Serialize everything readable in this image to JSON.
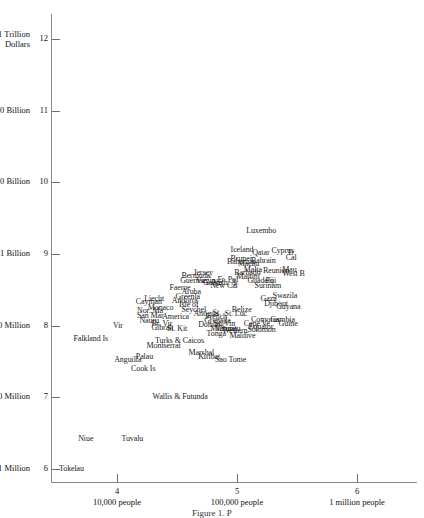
{
  "chart_data": {
    "type": "scatter",
    "title": "",
    "xlabel": "",
    "ylabel": "",
    "xlim": [
      3.45,
      6.5
    ],
    "ylim": [
      5.82,
      12.35
    ],
    "grid": false,
    "legend": null,
    "axis_note": "Both axes are log10 scales: x = log10(population), y = log10(GDP in dollars)",
    "y_ticks": [
      {
        "value": 12,
        "num": "12",
        "word": "1 Trillion Dollars"
      },
      {
        "value": 11,
        "num": "11",
        "word": "100 Billion"
      },
      {
        "value": 10,
        "num": "10",
        "word": "10 Billion"
      },
      {
        "value": 9,
        "num": "9",
        "word": "1 Billion"
      },
      {
        "value": 8,
        "num": "8",
        "word": "100 Million"
      },
      {
        "value": 7,
        "num": "7",
        "word": "10 Million"
      },
      {
        "value": 6,
        "num": "6",
        "word": "1 Million"
      }
    ],
    "x_ticks": [
      {
        "value": 4,
        "num": "4",
        "word": "10,000 people"
      },
      {
        "value": 5,
        "num": "5",
        "word": "100,000 people"
      },
      {
        "value": 6,
        "num": "6",
        "word": "1 million people"
      }
    ],
    "points": [
      {
        "label": "Tokelau",
        "x": 3.5,
        "y": 6.0
      },
      {
        "label": "Niue",
        "x": 3.66,
        "y": 6.42
      },
      {
        "label": "Tuvalu",
        "x": 4.02,
        "y": 6.42
      },
      {
        "label": "Wallis & Futunda",
        "x": 4.28,
        "y": 7.0
      },
      {
        "label": "Falkland Is",
        "x": 3.62,
        "y": 7.82
      },
      {
        "label": "Anguilla",
        "x": 3.96,
        "y": 7.52
      },
      {
        "label": "Cook Is",
        "x": 4.1,
        "y": 7.4
      },
      {
        "label": "Palau",
        "x": 4.14,
        "y": 7.57
      },
      {
        "label": "Montserrat",
        "x": 4.23,
        "y": 7.72
      },
      {
        "label": "Turks & Caicos",
        "x": 4.3,
        "y": 7.79
      },
      {
        "label": "Marshal",
        "x": 4.58,
        "y": 7.62
      },
      {
        "label": "Kiribat",
        "x": 4.66,
        "y": 7.56
      },
      {
        "label": "Sao Tome",
        "x": 4.8,
        "y": 7.52
      },
      {
        "label": "Nauru",
        "x": 4.17,
        "y": 8.07
      },
      {
        "label": "Br. Vir",
        "x": 4.27,
        "y": 8.02
      },
      {
        "label": "Gibralt",
        "x": 4.27,
        "y": 7.97
      },
      {
        "label": "St. Kit",
        "x": 4.4,
        "y": 7.96
      },
      {
        "label": "Vir",
        "x": 3.95,
        "y": 7.99
      },
      {
        "label": "San Mar",
        "x": 4.15,
        "y": 8.14
      },
      {
        "label": "America",
        "x": 4.36,
        "y": 8.12
      },
      {
        "label": "Nor. Ma",
        "x": 4.15,
        "y": 8.21
      },
      {
        "label": "Monaco",
        "x": 4.24,
        "y": 8.25
      },
      {
        "label": "Liecht",
        "x": 4.21,
        "y": 8.37
      },
      {
        "label": "Cayman",
        "x": 4.14,
        "y": 8.33
      },
      {
        "label": "Andorra",
        "x": 4.44,
        "y": 8.35
      },
      {
        "label": "Greenla",
        "x": 4.47,
        "y": 8.4
      },
      {
        "label": "Isle of",
        "x": 4.5,
        "y": 8.29
      },
      {
        "label": "Seychel",
        "x": 4.52,
        "y": 8.22
      },
      {
        "label": "Aruba",
        "x": 4.52,
        "y": 8.47
      },
      {
        "label": "Faeroe",
        "x": 4.42,
        "y": 8.52
      },
      {
        "label": "Antigua",
        "x": 4.62,
        "y": 8.17
      },
      {
        "label": "St.",
        "x": 4.78,
        "y": 8.18
      },
      {
        "label": "French",
        "x": 4.72,
        "y": 8.12
      },
      {
        "label": "Grenada",
        "x": 4.71,
        "y": 8.07
      },
      {
        "label": "Dominic",
        "x": 4.66,
        "y": 8.01
      },
      {
        "label": "St. Vin",
        "x": 4.79,
        "y": 8.02
      },
      {
        "label": "Microne",
        "x": 4.76,
        "y": 7.96
      },
      {
        "label": "Vanuatu",
        "x": 4.8,
        "y": 7.95
      },
      {
        "label": "Western",
        "x": 4.86,
        "y": 7.92
      },
      {
        "label": "Tonga",
        "x": 4.73,
        "y": 7.89
      },
      {
        "label": "Maldive",
        "x": 4.92,
        "y": 7.86
      },
      {
        "label": "Belize",
        "x": 4.94,
        "y": 8.22
      },
      {
        "label": "St. Luc",
        "x": 4.88,
        "y": 8.17
      },
      {
        "label": "Comoros",
        "x": 5.1,
        "y": 8.08
      },
      {
        "label": "Cape Ve",
        "x": 5.04,
        "y": 8.02
      },
      {
        "label": "Equator",
        "x": 5.08,
        "y": 7.98
      },
      {
        "label": "Solomon",
        "x": 5.07,
        "y": 7.94
      },
      {
        "label": "Gambia",
        "x": 5.26,
        "y": 8.08
      },
      {
        "label": "Guine",
        "x": 5.33,
        "y": 8.02
      },
      {
        "label": "Djibout",
        "x": 5.21,
        "y": 8.3
      },
      {
        "label": "Guyana",
        "x": 5.31,
        "y": 8.26
      },
      {
        "label": "Gaza",
        "x": 5.18,
        "y": 8.37
      },
      {
        "label": "Swazila",
        "x": 5.28,
        "y": 8.42
      },
      {
        "label": "Surinam",
        "x": 5.13,
        "y": 8.55
      },
      {
        "label": "Fiji",
        "x": 5.22,
        "y": 8.62
      },
      {
        "label": "Guadelo",
        "x": 5.07,
        "y": 8.62
      },
      {
        "label": "Martini",
        "x": 4.98,
        "y": 8.68
      },
      {
        "label": "Fr. Pol",
        "x": 4.82,
        "y": 8.64
      },
      {
        "label": "Neth. A",
        "x": 4.78,
        "y": 8.6
      },
      {
        "label": "Guam",
        "x": 4.7,
        "y": 8.6
      },
      {
        "label": "New Cal",
        "x": 4.76,
        "y": 8.56
      },
      {
        "label": "Virgin",
        "x": 4.64,
        "y": 8.63
      },
      {
        "label": "Guernse",
        "x": 4.51,
        "y": 8.63
      },
      {
        "label": "Bermuda",
        "x": 4.52,
        "y": 8.69
      },
      {
        "label": "Jersey",
        "x": 4.62,
        "y": 8.74
      },
      {
        "label": "Barbado",
        "x": 4.96,
        "y": 8.74
      },
      {
        "label": "Malta",
        "x": 5.04,
        "y": 8.78
      },
      {
        "label": "Reunion",
        "x": 5.2,
        "y": 8.76
      },
      {
        "label": "Mau",
        "x": 5.36,
        "y": 8.78
      },
      {
        "label": "West B",
        "x": 5.36,
        "y": 8.72
      },
      {
        "label": "Macau",
        "x": 4.99,
        "y": 8.86
      },
      {
        "label": "Bahamas",
        "x": 4.9,
        "y": 8.89
      },
      {
        "label": "Bahrain",
        "x": 5.1,
        "y": 8.9
      },
      {
        "label": "Brunei",
        "x": 4.93,
        "y": 8.93
      },
      {
        "label": "Qatar",
        "x": 5.11,
        "y": 9.02
      },
      {
        "label": "Cyprus",
        "x": 5.27,
        "y": 9.05
      },
      {
        "label": "Tr",
        "x": 5.4,
        "y": 9.02
      },
      {
        "label": "Cal",
        "x": 5.39,
        "y": 8.95
      },
      {
        "label": "Iceland",
        "x": 4.93,
        "y": 9.06
      },
      {
        "label": "Luxembo",
        "x": 5.06,
        "y": 9.32
      }
    ]
  },
  "caption": {
    "text": "Figure 1. P"
  }
}
